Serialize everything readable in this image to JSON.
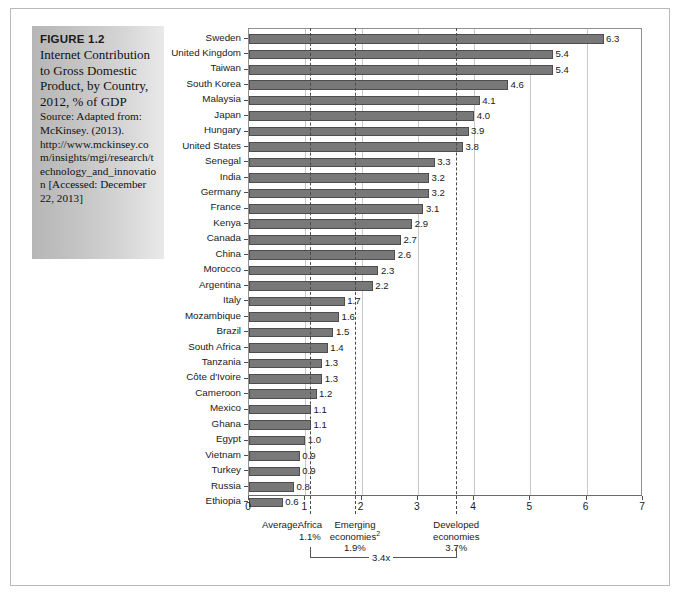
{
  "figure": {
    "number_label": "FIGURE 1.2",
    "description": "Internet Contribution to Gross Domestic Product, by Country, 2012, % of GDP",
    "source": "Source: Adapted from: McKinsey. (2013). http://www.mckinsey.com/insights/mgi/research/technology_and_innovation [Accessed: December 22, 2013]"
  },
  "chart_data": {
    "type": "bar",
    "orientation": "horizontal",
    "title": "Internet Contribution to Gross Domestic Product, by Country, 2012, % of GDP",
    "xlabel": "",
    "ylabel": "",
    "xlim": [
      0,
      7
    ],
    "xticks": [
      0,
      1,
      2,
      3,
      4,
      5,
      6,
      7
    ],
    "xtick_labels": [
      "0",
      "1",
      "2",
      "3",
      "4",
      "5",
      "6",
      "7"
    ],
    "grid": true,
    "legend": "none",
    "bar_color": "#787878",
    "categories": [
      "Sweden",
      "United Kingdom",
      "Taiwan",
      "South Korea",
      "Malaysia",
      "Japan",
      "Hungary",
      "United States",
      "Senegal",
      "India",
      "Germany",
      "France",
      "Kenya",
      "Canada",
      "China",
      "Morocco",
      "Argentina",
      "Italy",
      "Mozambique",
      "Brazil",
      "South Africa",
      "Tanzania",
      "Côte d'Ivoire",
      "Cameroon",
      "Mexico",
      "Ghana",
      "Egypt",
      "Vietnam",
      "Turkey",
      "Russia",
      "Ethiopia"
    ],
    "values": [
      6.3,
      5.4,
      5.4,
      4.6,
      4.1,
      4.0,
      3.9,
      3.8,
      3.3,
      3.2,
      3.2,
      3.1,
      2.9,
      2.7,
      2.6,
      2.3,
      2.2,
      1.7,
      1.6,
      1.5,
      1.4,
      1.3,
      1.3,
      1.2,
      1.1,
      1.1,
      1.0,
      0.9,
      0.9,
      0.8,
      0.6
    ],
    "value_labels": [
      "6.3",
      "5.4",
      "5.4",
      "4.6",
      "4.1",
      "4.0",
      "3.9",
      "3.8",
      "3.3",
      "3.2",
      "3.2",
      "3.1",
      "2.9",
      "2.7",
      "2.6",
      "2.3",
      "2.2",
      "1.7",
      "1.6",
      "1.5",
      "1.4",
      "1.3",
      "1.3",
      "1.2",
      "1.1",
      "1.1",
      "1.0",
      "0.9",
      "0.9",
      "0.8",
      "0.6"
    ],
    "reference_lines": [
      {
        "value": 1.1,
        "style": "dashed",
        "label": "Africa",
        "sublabel": "1.1%"
      },
      {
        "value": 1.9,
        "style": "dashed",
        "label": "Emerging economies",
        "label_superscript": "2",
        "sublabel": "1.9%"
      },
      {
        "value": 3.7,
        "style": "dashed",
        "label": "Developed economies",
        "sublabel": "3.7%"
      }
    ],
    "annotations": {
      "average_prefix": "Average:",
      "africa_name": "Africa",
      "africa_value": "1.1%",
      "emerging_name_line1": "Emerging",
      "emerging_name_line2": "economies",
      "emerging_superscript": "2",
      "emerging_value": "1.9%",
      "developed_name_line1": "Developed",
      "developed_name_line2": "economies",
      "developed_value": "3.7%",
      "bracket_label": "3.4x"
    }
  }
}
